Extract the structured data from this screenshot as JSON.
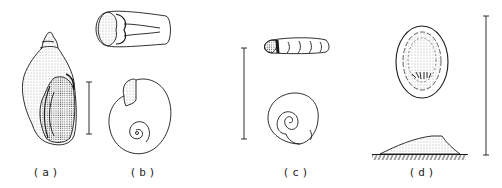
{
  "figure": {
    "panels": [
      {
        "id": "a",
        "label": "(a)",
        "subject": "elongate conical snail shell, apertural view",
        "scale_bar": true
      },
      {
        "id": "b",
        "label": "(b)",
        "subject": "planispiral shell, aperture view and apical view",
        "scale_bar": false
      },
      {
        "id": "c",
        "label": "(c)",
        "subject": "small planispiral shell, side view and apical view",
        "scale_bar": true
      },
      {
        "id": "d",
        "label": "(d)",
        "subject": "limpet shell, dorsal view and lateral profile on substrate",
        "scale_bar": true
      }
    ],
    "colors": {
      "ink": "#1a1a1a",
      "stipple": "#555555",
      "background": "#ffffff"
    }
  }
}
